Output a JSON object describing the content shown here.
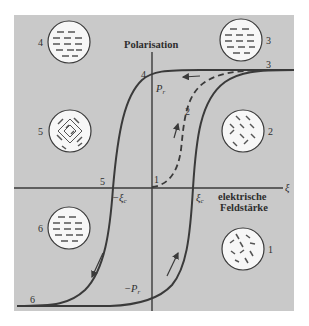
{
  "figure": {
    "colors": {
      "panel_bg": "#c9c9c9",
      "line": "#3a3a3a",
      "circle_fill": "#f7f7f7",
      "page_bg": "#ffffff"
    },
    "axes": {
      "y_label": "Polarisation",
      "x_symbol": "ξ",
      "x_label_line1": "elektrische",
      "x_label_line2": "Feldstärke"
    },
    "markers": {
      "pr": "P",
      "pr_sub": "r",
      "neg_pr": "−P",
      "neg_pr_sub": "r",
      "xi_c": "ξ",
      "xi_c_sub": "c",
      "neg_xi_c": "−ξ",
      "neg_xi_c_sub": "c"
    },
    "curve_points": {
      "p1": "1",
      "p2": "2",
      "p3": "3",
      "p4": "4",
      "p5": "5",
      "p6": "6"
    },
    "domain_circles": [
      {
        "label": "4",
        "state": "aligned-left"
      },
      {
        "label": "3",
        "state": "aligned-left-right"
      },
      {
        "label": "5",
        "state": "diagonal-mixed"
      },
      {
        "label": "2",
        "state": "diagonal-random"
      },
      {
        "label": "6",
        "state": "aligned-left"
      },
      {
        "label": "1",
        "state": "random"
      }
    ]
  }
}
